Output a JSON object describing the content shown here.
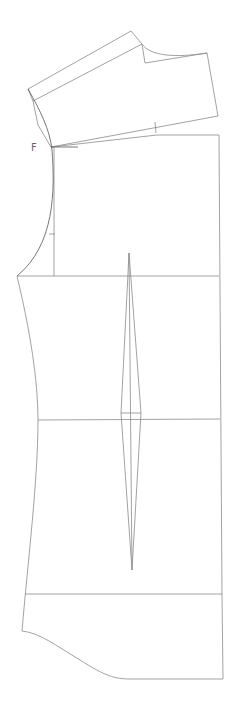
{
  "diagram": {
    "type": "sewing-pattern-draft",
    "line_color": "#8a8a8a",
    "background": "#ffffff",
    "labels": [
      {
        "id": "point-f",
        "text": "F",
        "x": 31,
        "y": 143
      }
    ],
    "pieces": {
      "shoulder_yoke": {
        "collar_band_outer": "M131,31 L28,89 L33,101",
        "collar_band_inner": "M142,44 L33,101",
        "collar_band_top": "M131,31 L142,44",
        "neck_curve": "M142,44 C150,56 175,58 207,53",
        "neck_notch": "M142,44 L145,63 L207,53",
        "shoulder_right": "M207,53 L218,116",
        "shoulder_bottom": "M218,116 L51,147",
        "shoulder_left": "M33,101 L38,125 L51,147",
        "shoulder_tick": "M155,122 L156,133"
      },
      "bodice": {
        "top_line": "M157,135 L219,135",
        "slope_line": "M51,147 L157,135",
        "f_tick": "M51,147 L78,147",
        "center_guide": "M54,147 L54,276",
        "armhole_curve": "M28,89 C40,110 50,130 52,150 C55,190 55,245 17,276",
        "armhole_tick": "M49,234 L55,234",
        "right_edge": "M219,135 L222,595 L223,679",
        "bust_line": "M17,276 L219,276",
        "waist_line": "M38,420 L220,419",
        "hip_line": "M25,594 L222,594",
        "side_seam": "M17,276 C30,330 38,380 38,420 C38,480 28,560 22,631",
        "hem_curve": "M22,631 C40,633 55,645 80,660 C105,676 115,679 130,679 L223,679"
      },
      "dart": {
        "apex_top": [
          129,
          253
        ],
        "apex_bottom": [
          132,
          570
        ],
        "widest_y": 413,
        "left_x": 121,
        "right_x": 141,
        "center_x": 131,
        "outline": "M129,253 L121,413 L132,570 L141,413 Z",
        "center_line": "M129,253 L132,570",
        "cross_line": "M121,413 L141,413"
      }
    }
  }
}
